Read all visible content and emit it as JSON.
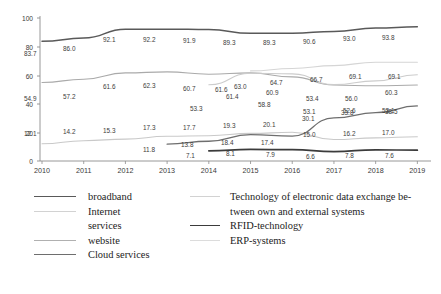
{
  "chart_data": {
    "type": "line",
    "title": "",
    "xlabel": "",
    "ylabel": "",
    "categories": [
      "2010",
      "2011",
      "2012",
      "2013",
      "2014",
      "2015",
      "2016",
      "2017",
      "2018",
      "2019"
    ],
    "ylim": [
      0,
      100
    ],
    "yticks": [
      "0",
      "20",
      "40",
      "60",
      "80",
      "100"
    ],
    "grid": false,
    "legend_position": "bottom",
    "series": [
      {
        "name": "broadband",
        "color": "#595959",
        "width": 1.5,
        "values": [
          83.7,
          86.0,
          92.1,
          92.2,
          91.9,
          89.3,
          89.3,
          90.6,
          93.0,
          93.8
        ]
      },
      {
        "name": "Internet services",
        "color": "#c9c9c9",
        "width": 1.1,
        "values": [
          12.1,
          14.2,
          15.3,
          17.3,
          17.7,
          19.3,
          20.1,
          15.0,
          16.2,
          17.0
        ]
      },
      {
        "name": "website",
        "color": "#aaaaaa",
        "width": 1.1,
        "values": [
          54.9,
          57.2,
          61.6,
          62.3,
          60.7,
          61.6,
          58.8,
          53.1,
          52.6,
          53.1
        ]
      },
      {
        "name": "Cloud services",
        "color": "#6e6e6e",
        "width": 1.3,
        "values": [
          null,
          null,
          null,
          11.8,
          13.8,
          18.4,
          17.4,
          30.1,
          33.8,
          38.5
        ]
      },
      {
        "name": "Technology of electronic data exchange between own and external systems",
        "color": "#cccccc",
        "width": 1.1,
        "values": [
          null,
          null,
          null,
          null,
          53.3,
          61.4,
          60.9,
          53.4,
          56.0,
          60.3
        ]
      },
      {
        "name": "RFID-technology",
        "color": "#3b3b3b",
        "width": 1.7,
        "values": [
          null,
          null,
          null,
          null,
          7.1,
          8.1,
          7.9,
          6.6,
          7.8,
          7.6
        ]
      },
      {
        "name": "ERP-systems",
        "color": "#d5d5d5",
        "width": 1.1,
        "values": [
          null,
          null,
          null,
          null,
          null,
          63.0,
          64.7,
          66.7,
          69.1,
          69.1
        ]
      }
    ],
    "point_labels": [
      {
        "text": "83.7",
        "x": 24,
        "y": 50
      },
      {
        "text": "86.0",
        "x": 63,
        "y": 45
      },
      {
        "text": "92.1",
        "x": 103,
        "y": 36
      },
      {
        "text": "92.2",
        "x": 143,
        "y": 36
      },
      {
        "text": "91.9",
        "x": 183,
        "y": 37
      },
      {
        "text": "89.3",
        "x": 223,
        "y": 39
      },
      {
        "text": "89.3",
        "x": 263,
        "y": 39
      },
      {
        "text": "90.6",
        "x": 303,
        "y": 38
      },
      {
        "text": "93.0",
        "x": 343,
        "y": 35
      },
      {
        "text": "93.8",
        "x": 382,
        "y": 34
      },
      {
        "text": "54.9",
        "x": 24,
        "y": 95
      },
      {
        "text": "57.2",
        "x": 63,
        "y": 93
      },
      {
        "text": "61.6",
        "x": 103,
        "y": 83
      },
      {
        "text": "62.3",
        "x": 143,
        "y": 82
      },
      {
        "text": "60.7",
        "x": 183,
        "y": 85
      },
      {
        "text": "61.6",
        "x": 215,
        "y": 86
      },
      {
        "text": "58.8",
        "x": 258,
        "y": 101
      },
      {
        "text": "53.1",
        "x": 303,
        "y": 108
      },
      {
        "text": "52.6",
        "x": 343,
        "y": 107
      },
      {
        "text": "53.1",
        "x": 382,
        "y": 107
      },
      {
        "text": "63.0",
        "x": 234,
        "y": 83
      },
      {
        "text": "64.7",
        "x": 270,
        "y": 79
      },
      {
        "text": "66.7",
        "x": 310,
        "y": 76
      },
      {
        "text": "69.1",
        "x": 349,
        "y": 73
      },
      {
        "text": "69.1",
        "x": 388,
        "y": 73
      },
      {
        "text": "53.3",
        "x": 190,
        "y": 105
      },
      {
        "text": "61.4",
        "x": 226,
        "y": 93
      },
      {
        "text": "60.9",
        "x": 266,
        "y": 89
      },
      {
        "text": "53.4",
        "x": 306,
        "y": 95
      },
      {
        "text": "56.0",
        "x": 345,
        "y": 95
      },
      {
        "text": "60.3",
        "x": 385,
        "y": 89
      },
      {
        "text": "12.1",
        "x": 24,
        "y": 130
      },
      {
        "text": "14.2",
        "x": 63,
        "y": 128
      },
      {
        "text": "15.3",
        "x": 103,
        "y": 127
      },
      {
        "text": "17.3",
        "x": 143,
        "y": 124
      },
      {
        "text": "17.7",
        "x": 183,
        "y": 124
      },
      {
        "text": "19.3",
        "x": 223,
        "y": 122
      },
      {
        "text": "20.1",
        "x": 263,
        "y": 121
      },
      {
        "text": "15.0",
        "x": 303,
        "y": 131
      },
      {
        "text": "16.2",
        "x": 343,
        "y": 130
      },
      {
        "text": "17.0",
        "x": 382,
        "y": 129
      },
      {
        "text": "11.8",
        "x": 143,
        "y": 146
      },
      {
        "text": "13.8",
        "x": 181,
        "y": 141
      },
      {
        "text": "18.4",
        "x": 221,
        "y": 139
      },
      {
        "text": "17.4",
        "x": 261,
        "y": 139
      },
      {
        "text": "30.1",
        "x": 302,
        "y": 115
      },
      {
        "text": "33.8",
        "x": 341,
        "y": 109
      },
      {
        "text": "38.5",
        "x": 385,
        "y": 108
      },
      {
        "text": "7.1",
        "x": 186,
        "y": 152
      },
      {
        "text": "8.1",
        "x": 226,
        "y": 150
      },
      {
        "text": "7.9",
        "x": 266,
        "y": 151
      },
      {
        "text": "6.6",
        "x": 306,
        "y": 153
      },
      {
        "text": "7.8",
        "x": 345,
        "y": 152
      },
      {
        "text": "7.6",
        "x": 385,
        "y": 152
      }
    ]
  },
  "axes": {
    "yticks": [
      {
        "label": "100",
        "y": 18
      },
      {
        "label": "80",
        "y": 47
      },
      {
        "label": "60",
        "y": 76
      },
      {
        "label": "40",
        "y": 104
      },
      {
        "label": "20",
        "y": 133
      },
      {
        "label": "0",
        "y": 161
      }
    ],
    "xticks": [
      {
        "label": "2010",
        "x": 39
      },
      {
        "label": "2011",
        "x": 79
      },
      {
        "label": "2012",
        "x": 119
      },
      {
        "label": "2013",
        "x": 159
      },
      {
        "label": "2014",
        "x": 199
      },
      {
        "label": "2015",
        "x": 239
      },
      {
        "label": "2016",
        "x": 279
      },
      {
        "label": "2017",
        "x": 319
      },
      {
        "label": "2018",
        "x": 359
      },
      {
        "label": "2019",
        "x": 399
      }
    ]
  },
  "legend": {
    "left_items": [
      {
        "label": "broadband",
        "color": "#595959",
        "width": 1.6
      },
      {
        "label": "Internet",
        "color": "#d2d2d2",
        "width": 1.4
      },
      {
        "label": "services",
        "color": null,
        "width": 0
      },
      {
        "label": "website",
        "color": "#b0b0b0",
        "width": 1.4
      },
      {
        "label": "Cloud services",
        "color": "#6e6e6e",
        "width": 1.5
      }
    ],
    "right_items": [
      {
        "label": "Technology of electronic data exchange be-",
        "color": "#d2d2d2",
        "width": 1.4
      },
      {
        "label": "tween own and external systems",
        "color": null,
        "width": 0
      },
      {
        "label": "RFID-technology",
        "color": "#3b3b3b",
        "width": 1.8
      },
      {
        "label": "ERP-systems",
        "color": "#dcdcdc",
        "width": 1.4
      }
    ]
  }
}
